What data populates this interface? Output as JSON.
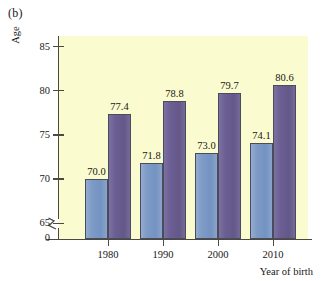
{
  "figure": {
    "panel_label": "(b)",
    "background_color": "#ffffff",
    "plot_background_color": "#fbfbd0",
    "axis_color": "#4a4a40"
  },
  "chart_data": {
    "type": "bar",
    "title": "",
    "panel": "(b)",
    "xlabel": "Year of birth",
    "ylabel": "Age",
    "categories": [
      "1980",
      "1990",
      "2000",
      "2010"
    ],
    "series": [
      {
        "name": "series-1",
        "color": "#7e9bc6",
        "values": [
          70.0,
          71.8,
          73.0,
          74.1
        ],
        "labels": [
          "70.0",
          "71.8",
          "73.0",
          "74.1"
        ]
      },
      {
        "name": "series-2",
        "color": "#6a5e94",
        "values": [
          77.4,
          78.8,
          79.7,
          80.6
        ],
        "labels": [
          "77.4",
          "78.8",
          "79.7",
          "80.6"
        ]
      }
    ],
    "ylim": [
      63.2,
      86.2
    ],
    "yticks": [
      85,
      80,
      75,
      70,
      65
    ],
    "ytick_labels": [
      "85",
      "80",
      "75",
      "70",
      "65"
    ],
    "y_zero_label": "0",
    "y_axis_break": true,
    "grid": false,
    "legend": "none",
    "bar_outline_color": "#4b4b5e"
  }
}
